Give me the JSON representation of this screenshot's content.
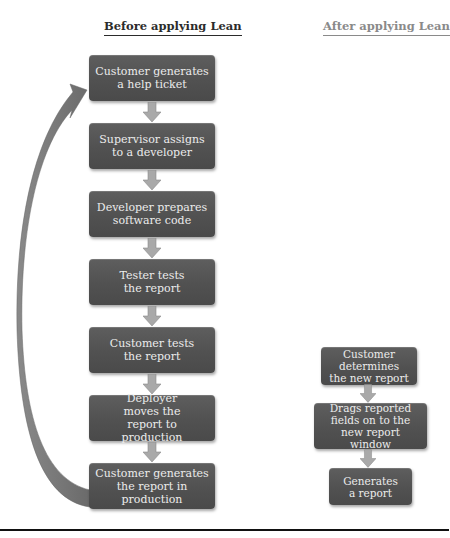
{
  "headings": {
    "before": "Before applying Lean",
    "after": "After applying Lean"
  },
  "before_flow": {
    "steps": [
      {
        "label": "Customer generates a help ticket"
      },
      {
        "label": "Supervisor assigns to a developer"
      },
      {
        "label": "Developer prepares software code"
      },
      {
        "label": "Tester tests the report"
      },
      {
        "label": "Customer tests the report"
      },
      {
        "label": "Deployer moves the report to production"
      },
      {
        "label": "Customer generates the report in production"
      }
    ],
    "loop_arrow": "curved-return-arrow"
  },
  "after_flow": {
    "steps": [
      {
        "label": "Customer determines the new report"
      },
      {
        "label": "Drags reported fields on to the new report window"
      },
      {
        "label": "Generates a report"
      }
    ]
  },
  "colors": {
    "box_fill": "#555555",
    "box_text": "#ececec",
    "arrow_fill": "#a9a9a9",
    "loop_arrow": "#777777",
    "rule": "#111111"
  }
}
